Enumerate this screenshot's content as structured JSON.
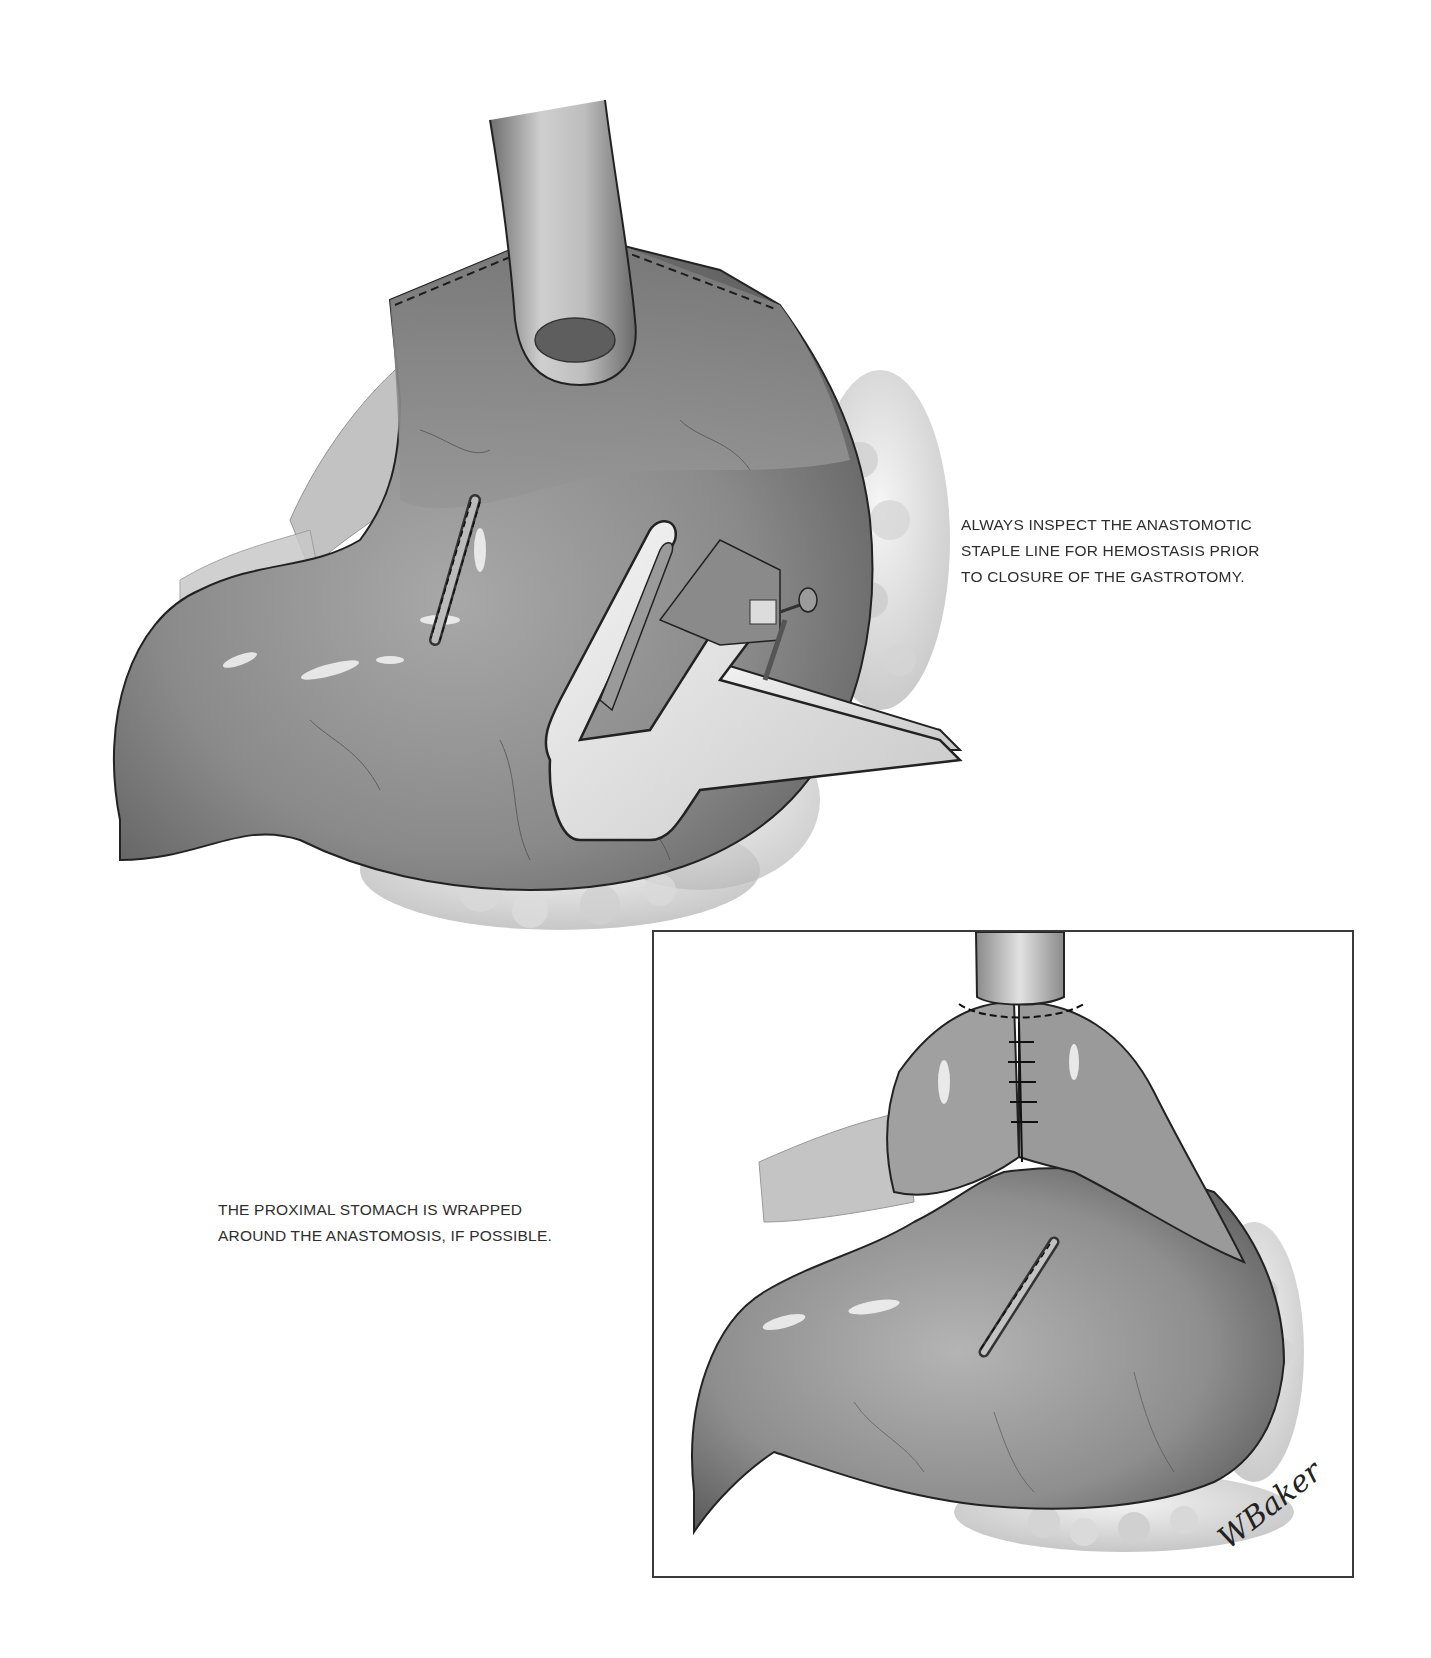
{
  "figure": {
    "main_illustration": {
      "description": "Stomach with esophagus inserted through proximal stomach; stapling instrument (GIA-type) inspecting anastomotic staple line through gastrotomy",
      "colors": {
        "tissue": "#8d8d8d",
        "tissue_light": "#c9c9c9",
        "tissue_dark": "#555555",
        "instrument": "#e6e6e6",
        "outline": "#222222"
      }
    },
    "inset": {
      "description": "Proximal stomach wrapped around the esophagogastric anastomosis with interrupted sutures; gastrotomy closed with staple line",
      "frame_color": "#3a3a3a",
      "signature": "WBaker"
    }
  },
  "captions": {
    "right": {
      "lines": [
        "ALWAYS INSPECT THE ANASTOMOTIC",
        "STAPLE LINE FOR HEMOSTASIS PRIOR",
        "TO CLOSURE OF THE GASTROTOMY."
      ]
    },
    "left": {
      "lines": [
        "THE PROXIMAL STOMACH IS WRAPPED",
        "AROUND THE ANASTOMOSIS, IF POSSIBLE."
      ]
    }
  }
}
